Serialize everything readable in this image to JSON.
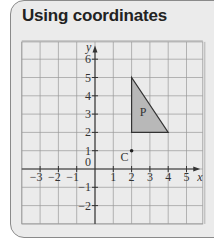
{
  "title": "Using coordinates",
  "chart_data": {
    "type": "diagram",
    "title": "Using coordinates",
    "xlabel": "x",
    "ylabel": "y",
    "xlim": [
      -4,
      6
    ],
    "ylim": [
      -3,
      7
    ],
    "x_ticks": [
      "-3",
      "-2",
      "-1",
      "1",
      "2",
      "3",
      "4",
      "5"
    ],
    "y_ticks": [
      "6",
      "5",
      "4",
      "3",
      "2",
      "1",
      "-1",
      "-2"
    ],
    "origin_label": "0",
    "grid": true,
    "shapes": [
      {
        "label": "P",
        "type": "triangle",
        "vertices": [
          [
            2,
            5
          ],
          [
            2,
            2
          ],
          [
            4,
            2
          ]
        ],
        "fill": "#b8b8b8"
      }
    ],
    "points": [
      {
        "label": "C",
        "x": 2,
        "y": 1
      }
    ]
  },
  "colors": {
    "background": "#ebebeb",
    "grid": "#9a9a9a",
    "axis": "#333333",
    "shape_fill": "#b8b8b8"
  }
}
